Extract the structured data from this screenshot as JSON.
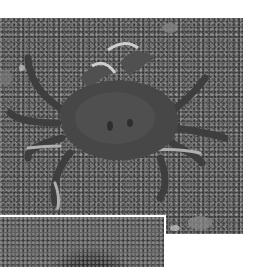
{
  "image": {
    "subject": "crab on gravel",
    "description": "Grayscale photograph of a crab on sandy gravel seen from above, with a second partially visible photo inset at bottom-left separated by a white border",
    "palette": {
      "background": "#ffffff",
      "gravel": "#6b6b6b",
      "crab_shell": "#4a4a4a",
      "crab_claw_tips": "#b8b8b8",
      "inset": "#5f5f5f",
      "border": "#ffffff"
    }
  }
}
